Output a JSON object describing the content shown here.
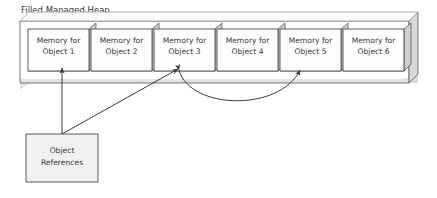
{
  "diagram": {
    "title": "Filled Managed Heap",
    "heap": {
      "name": "managed-heap",
      "cells": [
        {
          "line1": "Memory for",
          "line2": "Object 1"
        },
        {
          "line1": "Memory for",
          "line2": "Object 2"
        },
        {
          "line1": "Memory for",
          "line2": "Object 3"
        },
        {
          "line1": "Memory for",
          "line2": "Object 4"
        },
        {
          "line1": "Memory for",
          "line2": "Object 5"
        },
        {
          "line1": "Memory for",
          "line2": "Object 6"
        }
      ]
    },
    "references_box": {
      "line1": "Object",
      "line2": "References"
    },
    "connectors": [
      {
        "name": "ref-to-object-1",
        "kind": "straight-arrow",
        "from": "references-box",
        "to": "cell-1"
      },
      {
        "name": "ref-to-object-3",
        "kind": "straight-arrow",
        "from": "references-box",
        "to": "cell-3"
      },
      {
        "name": "object-3-to-object-5",
        "kind": "curved-double-arrow",
        "from": "cell-3",
        "to": "cell-5"
      }
    ],
    "colors": {
      "background": "#ffffff",
      "cell_fill": "#fdfdfd",
      "heap_fill": "#ffffff",
      "face_shadow": "#d4d4d4",
      "face_shadow_light": "#e0e0e0",
      "ref_box_fill": "#f0f0f0",
      "stroke": "#4a4a4a",
      "text": "#3a3a3a"
    }
  }
}
